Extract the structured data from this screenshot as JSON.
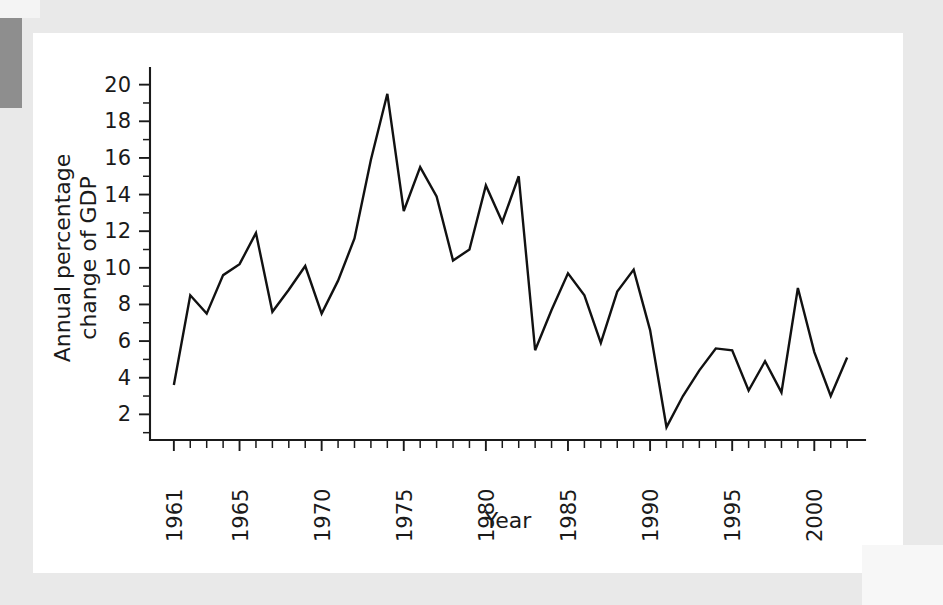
{
  "figure": {
    "background_color": "#ffffff",
    "page_background_color": "#e9e9e9",
    "edge_block_color": "#8e8e8e",
    "line_color": "#111111",
    "axis_color": "#1a1a1a"
  },
  "chart_data": {
    "type": "line",
    "title": "",
    "xlabel": "Year",
    "ylabel": "Annual percentage change of GDP",
    "ylabel_line1": "Annual percentage",
    "ylabel_line2": "change of GDP",
    "xlim": [
      1960.4,
      2002.6
    ],
    "ylim": [
      0.6,
      20.8
    ],
    "grid": false,
    "legend": null,
    "y_ticks_major": [
      2,
      4,
      6,
      8,
      10,
      12,
      14,
      16,
      18,
      20
    ],
    "y_tick_labels": [
      "2",
      "4",
      "6",
      "8",
      "10",
      "12",
      "14",
      "16",
      "18",
      "20"
    ],
    "y_minor_tick_step": 1,
    "x_ticks_major": [
      1961,
      1965,
      1970,
      1975,
      1980,
      1985,
      1990,
      1995,
      2000
    ],
    "x_tick_labels": [
      "1961",
      "1965",
      "1970",
      "1975",
      "1980",
      "1985",
      "1990",
      "1995",
      "2000"
    ],
    "x_tick_label_rotation": -90,
    "x_minor_tick_step": 1,
    "x": [
      1961,
      1962,
      1963,
      1964,
      1965,
      1966,
      1967,
      1968,
      1969,
      1970,
      1971,
      1972,
      1973,
      1974,
      1975,
      1976,
      1977,
      1978,
      1979,
      1980,
      1981,
      1982,
      1983,
      1984,
      1985,
      1986,
      1987,
      1988,
      1989,
      1990,
      1991,
      1992,
      1993,
      1994,
      1995,
      1996,
      1997,
      1998,
      1999,
      2000,
      2001,
      2002
    ],
    "values": [
      3.6,
      8.5,
      7.5,
      9.6,
      10.2,
      11.9,
      7.6,
      8.8,
      10.1,
      7.5,
      9.3,
      11.6,
      15.9,
      19.5,
      13.1,
      15.5,
      13.9,
      10.4,
      11.0,
      14.5,
      12.5,
      15.0,
      5.5,
      7.7,
      9.7,
      8.5,
      5.9,
      8.7,
      9.9,
      6.6,
      1.3,
      3.0,
      4.4,
      5.6,
      5.5,
      3.3,
      4.9,
      3.2,
      8.9,
      5.4,
      3.0,
      5.1
    ],
    "series_name": "Annual percentage change of GDP"
  }
}
